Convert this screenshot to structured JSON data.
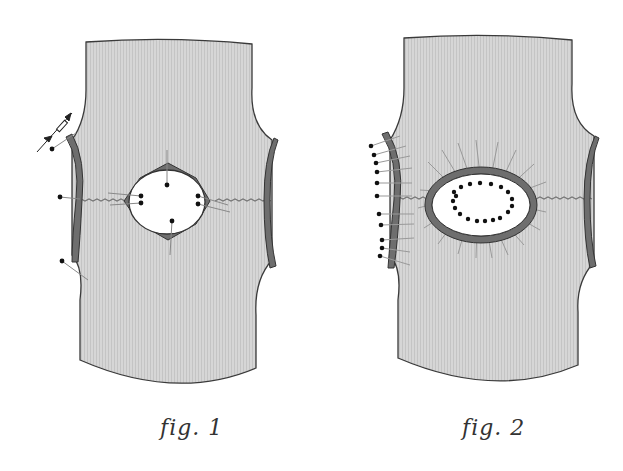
{
  "figures": [
    {
      "id": "fig1",
      "caption": "fig. 1",
      "description": "Knit fabric panel with diamond-shaped hole; edges pinned, measurement arrows at left edge"
    },
    {
      "id": "fig2",
      "caption": "fig. 2",
      "description": "Knit fabric panel with oval hole fully pinned around with many pins; left side edge pinned"
    }
  ],
  "colors": {
    "fabric": "#d4d4d4",
    "fabric_stripe": "#c6c6c6",
    "outline": "#3a3a3a",
    "binding": "#6e6e6e",
    "hole": "#ffffff",
    "pin_head": "#111111",
    "pin_shaft": "#888888",
    "zigzag": "#7a7a7a"
  }
}
